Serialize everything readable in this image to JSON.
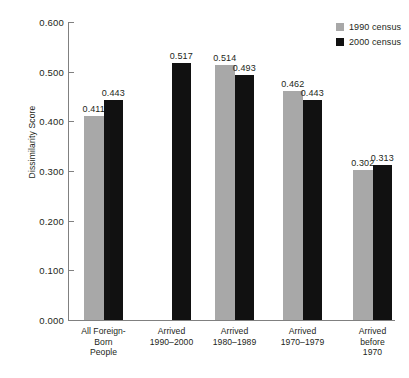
{
  "chart_data": {
    "type": "bar",
    "title": "",
    "xlabel": "",
    "ylabel": "Dissimilarity Score",
    "ylim": [
      0.0,
      0.6
    ],
    "ytick_labels": [
      "0.600",
      "0.500",
      "0.400",
      "0.300",
      "0.200",
      "0.100",
      "0.000"
    ],
    "ytick_values": [
      0.6,
      0.5,
      0.4,
      0.3,
      0.2,
      0.1,
      0.0
    ],
    "grid": false,
    "legend_position": "top-right",
    "categories": [
      "All Foreign-\nBorn\nPeople",
      "Arrived\n1990–2000",
      "Arrived\n1980–1989",
      "Arrived\n1970–1979",
      "Arrived\nbefore\n1970"
    ],
    "series": [
      {
        "name": "1990 census",
        "color": "#a8a8a8",
        "values": [
          0.411,
          null,
          0.514,
          0.462,
          0.302
        ],
        "labels": [
          "0.411",
          "",
          "0.514",
          "0.462",
          "0.302"
        ]
      },
      {
        "name": "2000 census",
        "color": "#111111",
        "values": [
          0.443,
          0.517,
          0.493,
          0.443,
          0.313
        ],
        "labels": [
          "0.443",
          "0.517",
          "0.493",
          "0.443",
          "0.313"
        ]
      }
    ]
  },
  "legend": {
    "items": [
      {
        "label": "1990 census",
        "color": "#a8a8a8"
      },
      {
        "label": "2000 census",
        "color": "#111111"
      }
    ]
  },
  "axis": {
    "y_title": "Dissimilarity Score"
  }
}
